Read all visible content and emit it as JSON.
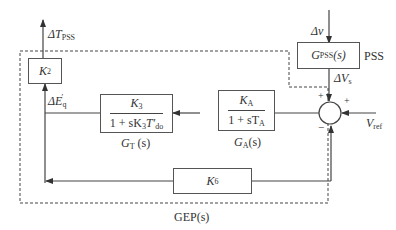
{
  "diagram": {
    "outer_block_label": "GEP(s)",
    "pss_label": "PSS",
    "blocks": {
      "k2": {
        "gain": "K",
        "gain_sub": "2"
      },
      "k6": {
        "gain": "K",
        "gain_sub": "6"
      },
      "gt": {
        "num": "K",
        "num_sub": "3",
        "den_prefix": "1 + sK",
        "den_k_sub": "3",
        "den_t": "T′",
        "den_t_sub": "do",
        "caption": "G",
        "caption_sub": "T",
        "caption_arg": " (s)"
      },
      "ga": {
        "num": "K",
        "num_sub": "A",
        "den_prefix": "1 + sT",
        "den_sub": "A",
        "caption": "G",
        "caption_sub": "A",
        "caption_arg": "(s)"
      },
      "gpss": {
        "text": "G",
        "text_sub": "PSS",
        "text_arg": "(s)"
      }
    },
    "signals": {
      "delta_t_pss": {
        "prefix": "ΔT",
        "sub": "PSS"
      },
      "delta_eq": {
        "prefix": "ΔE",
        "sub": "q",
        "sup": "′"
      },
      "delta_v_input": "Δv",
      "delta_vs": {
        "prefix": "ΔV",
        "sub": "s"
      },
      "v_ref": {
        "prefix": "V",
        "sub": "ref"
      }
    },
    "summing_junction": {
      "signs": [
        "+",
        "+",
        "−"
      ]
    }
  }
}
